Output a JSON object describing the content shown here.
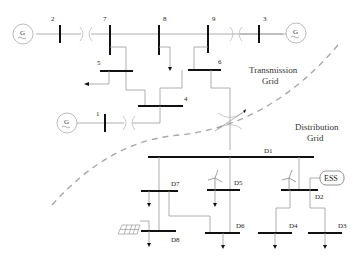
{
  "diagram": {
    "type": "power-system-single-line",
    "regions": {
      "transmission": {
        "line1": "Transmission",
        "line2": "Grid"
      },
      "distribution": {
        "line1": "Distribution",
        "line2": "Grid"
      }
    },
    "transmission_buses": [
      "1",
      "2",
      "3",
      "4",
      "5",
      "6",
      "7",
      "8",
      "9"
    ],
    "generators": [
      {
        "id": "gen-bus2",
        "symbol": "G",
        "bus": "2"
      },
      {
        "id": "gen-bus3",
        "symbol": "G",
        "bus": "3"
      },
      {
        "id": "gen-bus1",
        "symbol": "G",
        "bus": "1"
      }
    ],
    "distribution_buses": [
      "D1",
      "D2",
      "D3",
      "D4",
      "D5",
      "D6",
      "D7",
      "D8"
    ],
    "storage": {
      "label": "ESS",
      "bus": "D2"
    },
    "wind_turbines": [
      {
        "bus": "D5"
      },
      {
        "bus": "D2"
      }
    ],
    "pv": [
      {
        "bus": "D8"
      }
    ],
    "loads": [
      "5",
      "8",
      "D7",
      "D8",
      "D5",
      "D6",
      "D4",
      "D3"
    ]
  }
}
